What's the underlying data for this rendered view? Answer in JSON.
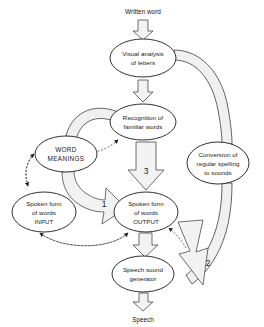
{
  "diagram": {
    "colors": {
      "stroke": "#1a1a1a",
      "arrow_fill": "#f2f2f2",
      "arrow_stroke": "#4a4a4a",
      "band_fill": "#f0f0f0",
      "background": "#ffffff"
    },
    "io_labels": {
      "input": "Written word",
      "output": "Speech"
    },
    "nodes": [
      {
        "id": "visual-analysis",
        "lines": [
          "Visual analysis",
          "of letters"
        ],
        "cx": 143,
        "cy": 58,
        "rx": 33,
        "ry": 19
      },
      {
        "id": "recognition-familiar-words",
        "lines": [
          "Recognition of",
          "familiar words"
        ],
        "cx": 143,
        "cy": 122,
        "rx": 33,
        "ry": 18
      },
      {
        "id": "word-meanings",
        "lines": [
          "WORD",
          "MEANINGS"
        ],
        "cx": 66,
        "cy": 154,
        "rx": 31,
        "ry": 18
      },
      {
        "id": "conversion-regular-spelling",
        "lines": [
          "Conversion of",
          "regular spelling",
          "to sounds"
        ],
        "cx": 218,
        "cy": 163,
        "rx": 31,
        "ry": 21
      },
      {
        "id": "spoken-form-input",
        "lines": [
          "Spoken form",
          "of words",
          "INPUT"
        ],
        "cx": 44,
        "cy": 212,
        "rx": 32,
        "ry": 20
      },
      {
        "id": "spoken-form-output",
        "lines": [
          "Spoken form",
          "of words",
          "OUTPUT"
        ],
        "cx": 146,
        "cy": 212,
        "rx": 32,
        "ry": 20
      },
      {
        "id": "speech-sound-generator",
        "lines": [
          "Speech sound",
          "generator"
        ],
        "cx": 143,
        "cy": 274,
        "rx": 31,
        "ry": 18
      }
    ],
    "numbered_routes": [
      {
        "number": "1",
        "label": "1",
        "x": 104,
        "y": 207,
        "from": "word-meanings",
        "to": "spoken-form-output"
      },
      {
        "number": "2",
        "label": "2",
        "x": 208,
        "y": 266,
        "from": "conversion-regular-spelling",
        "to": "speech-sound-generator"
      },
      {
        "number": "3",
        "label": "3",
        "x": 146,
        "y": 174,
        "from": "recognition-familiar-words",
        "to": "spoken-form-output"
      }
    ]
  }
}
